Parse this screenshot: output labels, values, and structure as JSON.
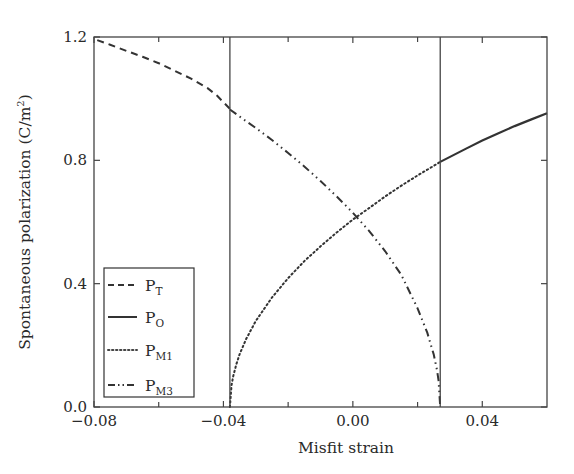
{
  "chart_data": {
    "type": "line",
    "title": "",
    "xlabel": "Misfit strain",
    "ylabel": "Spontaneous polarization (C/m",
    "ylabel_sup": "2",
    "ylabel_close": ")",
    "xlim": [
      -0.08,
      0.06
    ],
    "ylim": [
      0.0,
      1.2
    ],
    "x_major_ticks": [
      -0.08,
      -0.04,
      0.0,
      0.04
    ],
    "x_major_tick_labels": [
      "−0.08",
      "−0.04",
      "0.00",
      "0.04"
    ],
    "x_minor_ticks": [
      -0.06,
      -0.02,
      0.02
    ],
    "y_major_ticks": [
      0.0,
      0.4,
      0.8,
      1.2
    ],
    "y_major_tick_labels": [
      "0.0",
      "0.4",
      "0.8",
      "1.2"
    ],
    "grid": false,
    "phase_boundaries": [
      -0.038,
      0.027
    ],
    "legend": {
      "placement": "lower-left",
      "entries": [
        {
          "base": "P",
          "sub": "T",
          "style": "dashed"
        },
        {
          "base": "P",
          "sub": "O",
          "style": "solid"
        },
        {
          "base": "P",
          "sub": "M1",
          "style": "dotted"
        },
        {
          "base": "P",
          "sub": "M3",
          "style": "dash-dot"
        }
      ]
    },
    "series": [
      {
        "name": "P_T",
        "style": "dashed",
        "x": [
          -0.079,
          -0.075,
          -0.07,
          -0.065,
          -0.06,
          -0.055,
          -0.05,
          -0.045,
          -0.042,
          -0.038
        ],
        "y": [
          1.19,
          1.175,
          1.155,
          1.136,
          1.115,
          1.09,
          1.065,
          1.035,
          1.01,
          0.967
        ]
      },
      {
        "name": "P_O",
        "style": "solid",
        "x": [
          0.027,
          0.035,
          0.04,
          0.045,
          0.05,
          0.055,
          0.06
        ],
        "y": [
          0.795,
          0.838,
          0.864,
          0.888,
          0.911,
          0.932,
          0.953
        ]
      },
      {
        "name": "P_M1",
        "style": "dotted",
        "x": [
          -0.038,
          -0.0375,
          -0.037,
          -0.036,
          -0.035,
          -0.033,
          -0.03,
          -0.025,
          -0.02,
          -0.015,
          -0.01,
          -0.005,
          0.0,
          0.005,
          0.01,
          0.015,
          0.02,
          0.025,
          0.027
        ],
        "y": [
          0.0,
          0.07,
          0.099,
          0.139,
          0.171,
          0.22,
          0.279,
          0.355,
          0.418,
          0.473,
          0.521,
          0.566,
          0.608,
          0.645,
          0.683,
          0.718,
          0.751,
          0.782,
          0.795
        ]
      },
      {
        "name": "P_M3",
        "style": "dash-dot",
        "x": [
          -0.038,
          -0.035,
          -0.03,
          -0.025,
          -0.02,
          -0.015,
          -0.01,
          -0.005,
          0.0,
          0.005,
          0.01,
          0.015,
          0.02,
          0.023,
          0.025,
          0.026,
          0.0265,
          0.027
        ],
        "y": [
          0.965,
          0.942,
          0.905,
          0.866,
          0.824,
          0.78,
          0.733,
          0.683,
          0.63,
          0.571,
          0.505,
          0.428,
          0.32,
          0.241,
          0.17,
          0.12,
          0.085,
          0.0
        ]
      }
    ]
  }
}
